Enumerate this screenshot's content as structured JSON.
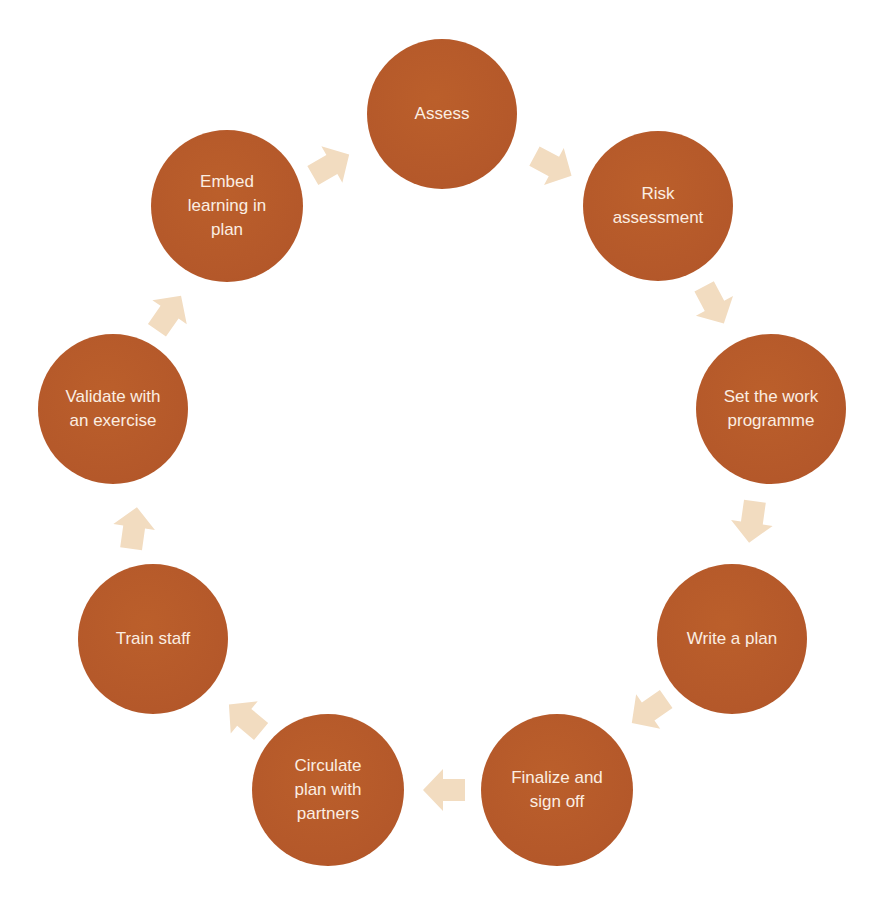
{
  "diagram": {
    "type": "cycle",
    "colors": {
      "node_fill": "#b65a27",
      "node_text": "#fbeee2",
      "arrow_fill": "#f2dcc0",
      "background": "#ffffff"
    },
    "nodes": [
      {
        "id": "assess",
        "label": "Assess",
        "cx": 442,
        "cy": 114,
        "r": 75
      },
      {
        "id": "risk-assessment",
        "label": "Risk assessment",
        "cx": 658,
        "cy": 206,
        "r": 75
      },
      {
        "id": "set-work-programme",
        "label": "Set the work programme",
        "cx": 771,
        "cy": 409,
        "r": 75
      },
      {
        "id": "write-plan",
        "label": "Write a plan",
        "cx": 732,
        "cy": 639,
        "r": 75
      },
      {
        "id": "finalize-sign-off",
        "label": "Finalize and sign off",
        "cx": 557,
        "cy": 790,
        "r": 76
      },
      {
        "id": "circulate-plan",
        "label": "Circulate plan with partners",
        "cx": 328,
        "cy": 790,
        "r": 76
      },
      {
        "id": "train-staff",
        "label": "Train staff",
        "cx": 153,
        "cy": 639,
        "r": 75
      },
      {
        "id": "validate-exercise",
        "label": "Validate with an exercise",
        "cx": 113,
        "cy": 409,
        "r": 75
      },
      {
        "id": "embed-learning",
        "label": "Embed learning in plan",
        "cx": 227,
        "cy": 206,
        "r": 76
      }
    ],
    "node_lines": [
      [
        "Assess"
      ],
      [
        "Risk",
        "assessment"
      ],
      [
        "Set the work",
        "programme"
      ],
      [
        "Write a plan"
      ],
      [
        "Finalize and",
        "sign off"
      ],
      [
        "Circulate",
        "plan with",
        "partners"
      ],
      [
        "Train staff"
      ],
      [
        "Validate with",
        "an exercise"
      ],
      [
        "Embed",
        "learning in",
        "plan"
      ]
    ],
    "edges": [
      {
        "from": "assess",
        "to": "risk-assessment"
      },
      {
        "from": "risk-assessment",
        "to": "set-work-programme"
      },
      {
        "from": "set-work-programme",
        "to": "write-plan"
      },
      {
        "from": "write-plan",
        "to": "finalize-sign-off"
      },
      {
        "from": "finalize-sign-off",
        "to": "circulate-plan"
      },
      {
        "from": "circulate-plan",
        "to": "train-staff"
      },
      {
        "from": "train-staff",
        "to": "validate-exercise"
      },
      {
        "from": "validate-exercise",
        "to": "embed-learning"
      },
      {
        "from": "embed-learning",
        "to": "assess"
      }
    ]
  }
}
